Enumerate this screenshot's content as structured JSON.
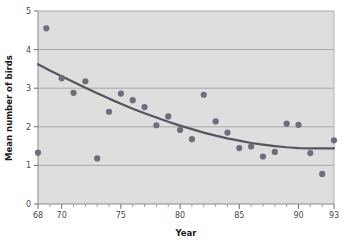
{
  "chart_data": {
    "type": "scatter",
    "title": "",
    "xlabel": "Year",
    "ylabel": "Mean number of birds",
    "xlim": [
      68,
      93
    ],
    "ylim": [
      0,
      5
    ],
    "grid": true,
    "legend": false,
    "xticks_major": [
      68,
      70,
      75,
      80,
      85,
      90,
      93
    ],
    "xtick_labels": [
      "68",
      "70",
      "75",
      "80",
      "85",
      "90",
      "93"
    ],
    "xticks_minor": [
      69,
      71,
      72,
      73,
      74,
      76,
      77,
      78,
      79,
      81,
      82,
      83,
      84,
      86,
      87,
      88,
      89,
      91,
      92
    ],
    "yticks": [
      0,
      1,
      2,
      3,
      4,
      5
    ],
    "ytick_labels": [
      "0",
      "1",
      "2",
      "3",
      "4",
      "5"
    ],
    "marker_color": "#6e6e7a",
    "line_color": "#555560",
    "plot_bg_color": "#dedede",
    "grid_color": "#9a9a9a",
    "axis_color": "#8a8a8a",
    "series": [
      {
        "name": "Mean number of birds",
        "type": "scatter",
        "x": [
          68.0,
          68.7,
          70.0,
          71.0,
          72.0,
          73.0,
          74.0,
          75.0,
          76.0,
          77.0,
          78.0,
          79.0,
          80.0,
          81.0,
          82.0,
          83.0,
          84.0,
          85.0,
          86.0,
          87.0,
          88.0,
          89.0,
          90.0,
          91.0,
          92.0,
          93.0
        ],
        "y": [
          1.33,
          4.55,
          3.26,
          2.88,
          3.18,
          1.18,
          2.39,
          2.86,
          2.69,
          2.51,
          2.04,
          2.27,
          1.92,
          1.68,
          2.83,
          2.14,
          1.85,
          1.45,
          1.49,
          1.23,
          1.35,
          2.08,
          2.05,
          1.32,
          0.78,
          1.65
        ]
      },
      {
        "name": "fitted trend",
        "type": "line",
        "x": [
          68,
          69,
          70,
          71,
          72,
          73,
          74,
          75,
          76,
          77,
          78,
          79,
          80,
          81,
          82,
          83,
          84,
          85,
          86,
          87,
          88,
          89,
          90,
          91,
          92,
          93
        ],
        "y": [
          3.62,
          3.46,
          3.31,
          3.16,
          3.01,
          2.87,
          2.73,
          2.6,
          2.47,
          2.35,
          2.24,
          2.13,
          2.03,
          1.94,
          1.85,
          1.77,
          1.7,
          1.64,
          1.58,
          1.54,
          1.5,
          1.47,
          1.45,
          1.44,
          1.44,
          1.44
        ]
      }
    ]
  }
}
